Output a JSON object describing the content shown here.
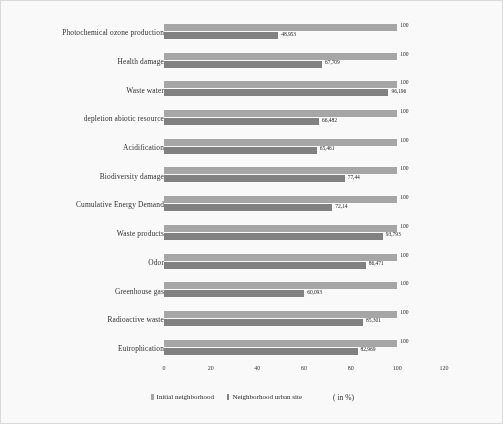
{
  "chart_data": {
    "type": "bar",
    "orientation": "horizontal",
    "title": "",
    "xlabel": "",
    "ylabel": "",
    "unit_note": "( in %)",
    "xlim": [
      0,
      120
    ],
    "xticks": [
      0,
      20,
      40,
      60,
      80,
      100,
      120
    ],
    "xtick_labels": [
      "0",
      "20",
      "40",
      "60",
      "80",
      "100",
      "120"
    ],
    "grid": false,
    "legend_position": "bottom",
    "categories": [
      "Photochemical ozone production",
      "Health damage",
      "Waste water",
      "depletion abiotic resource",
      "Acidification",
      "Biodiversity damage",
      "Cumulative Energy Demand",
      "Waste products",
      "Odor",
      "Greenhouse gas",
      "Radioactive waste",
      "Eutrophication"
    ],
    "series": [
      {
        "name": "Initial neighborhood",
        "color": "#a5a5a5",
        "values": [
          100,
          100,
          100,
          100,
          100,
          100,
          100,
          100,
          100,
          100,
          100,
          100
        ],
        "labels": [
          "100",
          "100",
          "100",
          "100",
          "100",
          "100",
          "100",
          "100",
          "100",
          "100",
          "100",
          "100"
        ]
      },
      {
        "name": "Neighborhood urban site",
        "color": "#7e7e7e",
        "values": [
          48.953,
          67.709,
          96.196,
          66.482,
          65.461,
          77.44,
          72.14,
          93.793,
          86.471,
          60.093,
          85.301,
          82.969
        ],
        "labels": [
          "48,953",
          "67,709",
          "96,196",
          "66,482",
          "65,461",
          "77,44",
          "72,14",
          "93,793",
          "86,471",
          "60,093",
          "85,301",
          "82,969"
        ]
      }
    ]
  },
  "legend": {
    "items": [
      {
        "label": "Initial neighborhood"
      },
      {
        "label": "Neighborhood urban site"
      }
    ]
  }
}
